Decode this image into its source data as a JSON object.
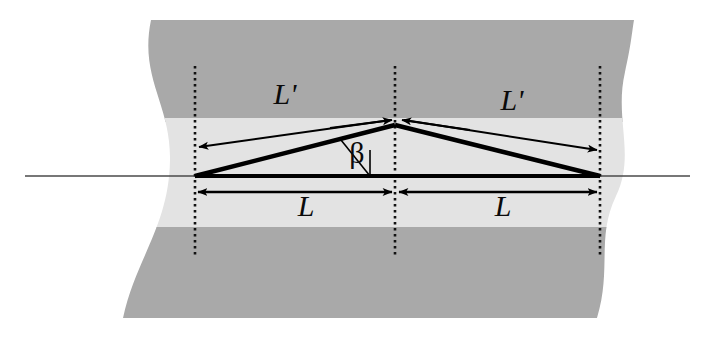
{
  "figure": {
    "kind": "geometry-diagram",
    "title_text": "",
    "background_color": "#ffffff",
    "ribbon": {
      "dark_band_color": "#a9a9a9",
      "light_band_color": "#e2e2e2",
      "left_edge_wave_x": 150,
      "right_edge_wave_x": 620,
      "top_y": 20,
      "bottom_y": 320,
      "light_band_top_y": 118,
      "light_band_bottom_y": 228
    },
    "axis_line": {
      "name": "horizontal-reference-line",
      "color": "#3c3c3c",
      "y": 176,
      "x_start": 25,
      "x_end": 690
    },
    "dotted_lines": [
      {
        "name": "left-dotted-guide",
        "x": 195,
        "y_top": 66,
        "y_bottom": 256
      },
      {
        "name": "center-dotted-guide",
        "x": 395,
        "y_top": 66,
        "y_bottom": 256
      },
      {
        "name": "right-dotted-guide",
        "x": 600,
        "y_top": 66,
        "y_bottom": 256
      }
    ],
    "triangle": {
      "name": "kinked-chain-triangle",
      "stroke_color": "#000000",
      "left_vertex": {
        "x": 195,
        "y": 176
      },
      "apex": {
        "x": 395,
        "y": 125
      },
      "right_vertex": {
        "x": 600,
        "y": 176
      }
    },
    "labels": [
      {
        "id": "L-prime-left",
        "text": "L'",
        "x": 285,
        "y": 104,
        "italic": true
      },
      {
        "id": "L-prime-right",
        "text": "L'",
        "x": 512,
        "y": 110,
        "italic": true
      },
      {
        "id": "beta",
        "text": "β",
        "x": 357,
        "y": 162,
        "italic": false
      },
      {
        "id": "L-left",
        "text": "L",
        "x": 306,
        "y": 215,
        "italic": true
      },
      {
        "id": "L-right",
        "text": "L",
        "x": 503,
        "y": 215,
        "italic": true
      }
    ],
    "arrows": [
      {
        "id": "arrow-Lprime-left",
        "from": {
          "x": 392,
          "y": 121
        },
        "to": {
          "x": 197,
          "y": 148
        },
        "double": false,
        "label": "L'"
      },
      {
        "id": "arrow-Lprime-right",
        "from": {
          "x": 400,
          "y": 121
        },
        "to": {
          "x": 598,
          "y": 151
        },
        "double": false,
        "label": "L'"
      },
      {
        "id": "arrow-L-left",
        "from": {
          "x": 393,
          "y": 192
        },
        "to": {
          "x": 197,
          "y": 192
        },
        "double": true,
        "label": "L"
      },
      {
        "id": "arrow-L-right",
        "from": {
          "x": 398,
          "y": 192
        },
        "to": {
          "x": 598,
          "y": 192
        },
        "double": true,
        "label": "L"
      }
    ],
    "angle_marker": {
      "name": "beta-angle-arc",
      "vertex": {
        "x": 395,
        "y": 176
      },
      "color": "#000000"
    }
  }
}
